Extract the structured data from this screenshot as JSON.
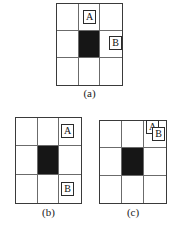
{
  "figure": {
    "background_color": "#ffffff",
    "grid_line_color": "#6b6b6b",
    "grid_border_color": "#3a3a3a",
    "filled_cell_color": "#161616",
    "tag_border_color": "#2b2b2b",
    "text_color": "#111111"
  },
  "panels": [
    {
      "id": "a",
      "caption": "(a)",
      "grid": {
        "rows": 3,
        "columns": 3,
        "cells": [
          [
            "empty",
            "empty",
            "empty"
          ],
          [
            "empty",
            "filled",
            "empty"
          ],
          [
            "empty",
            "empty",
            "empty"
          ]
        ]
      },
      "tags": [
        {
          "label": "A",
          "cell_row": 1,
          "cell_col": 2
        },
        {
          "label": "B",
          "cell_row": 2,
          "cell_col": 3
        }
      ]
    },
    {
      "id": "b",
      "caption": "(b)",
      "grid": {
        "rows": 3,
        "columns": 3,
        "cells": [
          [
            "empty",
            "empty",
            "empty"
          ],
          [
            "empty",
            "filled",
            "empty"
          ],
          [
            "empty",
            "empty",
            "empty"
          ]
        ]
      },
      "tags": [
        {
          "label": "A",
          "cell_row": 1,
          "cell_col": 3
        },
        {
          "label": "B",
          "cell_row": 3,
          "cell_col": 3
        }
      ]
    },
    {
      "id": "c",
      "caption": "(c)",
      "grid": {
        "rows": 3,
        "columns": 3,
        "cells": [
          [
            "empty",
            "empty",
            "empty"
          ],
          [
            "empty",
            "filled",
            "empty"
          ],
          [
            "empty",
            "empty",
            "empty"
          ]
        ]
      },
      "tags": [
        {
          "label": "A",
          "cell_row": 1,
          "cell_col": 3
        },
        {
          "label": "B",
          "cell_row": 1,
          "cell_col": 3
        }
      ]
    }
  ]
}
